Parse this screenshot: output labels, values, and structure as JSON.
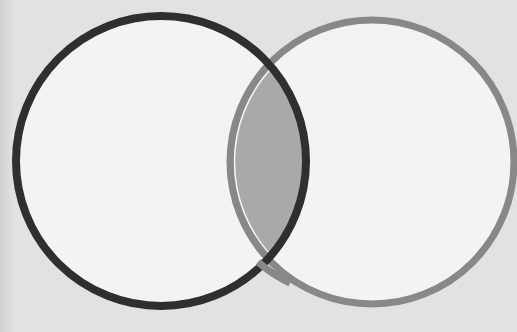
{
  "diagram": {
    "type": "venn",
    "set_count": 2,
    "sets": [
      {
        "name": "left-set",
        "label": "",
        "stroke_color": "#2f2f2f",
        "fill_color": "#f3f3f3",
        "cx": 161,
        "cy": 161,
        "r": 145,
        "stroke_width": 8
      },
      {
        "name": "right-set",
        "label": "",
        "stroke_color": "#888888",
        "fill_color": "#f3f3f3",
        "cx": 372,
        "cy": 162,
        "r": 142,
        "stroke_width": 7
      }
    ],
    "intersection": {
      "fill_color": "#a9a9a9",
      "highlighted": true,
      "label": ""
    },
    "background_color": "#e2e2e2"
  }
}
